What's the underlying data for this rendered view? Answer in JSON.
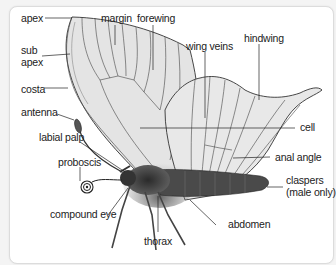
{
  "diagram": {
    "labels": {
      "apex": "apex",
      "margin": "margin",
      "forewing": "forewing",
      "sub_apex_line1": "sub",
      "sub_apex_line2": "apex",
      "hindwing": "hindwing",
      "wing_veins": "wing veins",
      "costa": "costa",
      "antenna": "antenna",
      "cell": "cell",
      "labial_palp": "labial palp",
      "proboscis": "proboscis",
      "anal_angle": "anal angle",
      "claspers_line1": "claspers",
      "claspers_line2": "(male only)",
      "compound_eye": "compound eye",
      "abdomen": "abdomen",
      "thorax": "thorax"
    },
    "colors": {
      "background": "#f4f4f4",
      "panel": "#ffffff",
      "wing_fill": "#e6e6e6",
      "line": "#333333",
      "body": "#3a3a3a"
    }
  }
}
